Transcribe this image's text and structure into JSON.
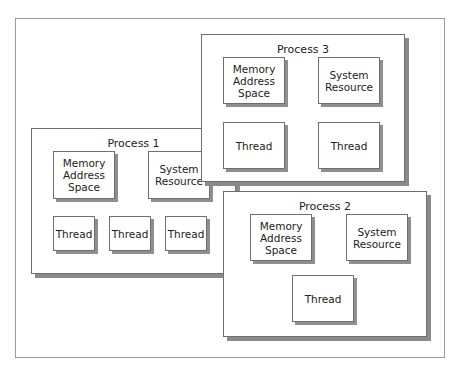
{
  "diagram": {
    "processes": [
      {
        "id": "process-1",
        "title": "Process 1",
        "resources": [
          "Memory Address Space",
          "System Resource"
        ],
        "threads": [
          "Thread",
          "Thread",
          "Thread"
        ]
      },
      {
        "id": "process-2",
        "title": "Process 2",
        "resources": [
          "Memory Address Space",
          "System Resource"
        ],
        "threads": [
          "Thread"
        ]
      },
      {
        "id": "process-3",
        "title": "Process 3",
        "resources": [
          "Memory Address Space",
          "System Resource"
        ],
        "threads": [
          "Thread",
          "Thread"
        ]
      }
    ],
    "labels": {
      "mem1": "Memory",
      "mem2": "Address",
      "mem3": "Space",
      "sys1": "System",
      "sys2": "Resource",
      "thread": "Thread"
    }
  }
}
